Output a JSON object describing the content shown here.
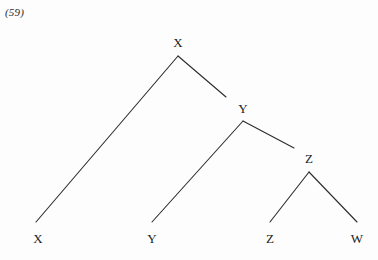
{
  "figure": {
    "example_number": "(59)",
    "type": "syntax-tree-diagram",
    "background_color": "#fdfdfd",
    "line_color": "#2b2b2b",
    "text_color": "#1c1c1c"
  },
  "nodes": {
    "root": {
      "label": "X",
      "x": 178,
      "y": 42
    },
    "mid": {
      "label": "Y",
      "x": 243,
      "y": 108
    },
    "low": {
      "label": "Z",
      "x": 309,
      "y": 158
    }
  },
  "terminals": [
    {
      "label": "X",
      "x": 38,
      "y": 238
    },
    {
      "label": "Y",
      "x": 152,
      "y": 238
    },
    {
      "label": "Z",
      "x": 270,
      "y": 238
    },
    {
      "label": "W",
      "x": 357,
      "y": 238
    }
  ],
  "branches": [
    {
      "name": "root-to-left-terminal-X",
      "x1": 178,
      "y1": 56,
      "x2": 36,
      "y2": 222
    },
    {
      "name": "root-to-mid-Y",
      "x1": 178,
      "y1": 56,
      "x2": 226,
      "y2": 97
    },
    {
      "name": "mid-to-left-terminal-Y",
      "x1": 243,
      "y1": 121,
      "x2": 152,
      "y2": 222
    },
    {
      "name": "mid-to-low-Z",
      "x1": 243,
      "y1": 121,
      "x2": 294,
      "y2": 148
    },
    {
      "name": "low-to-terminal-Z",
      "x1": 309,
      "y1": 172,
      "x2": 270,
      "y2": 222
    },
    {
      "name": "low-to-terminal-W",
      "x1": 309,
      "y1": 172,
      "x2": 357,
      "y2": 222
    }
  ]
}
